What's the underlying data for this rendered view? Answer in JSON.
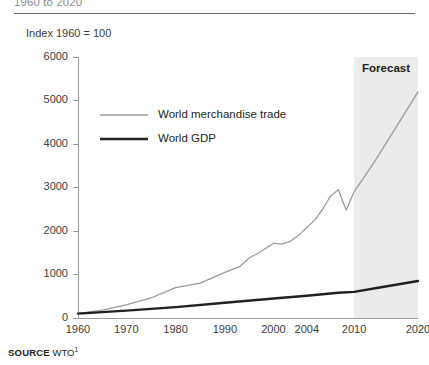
{
  "figure": {
    "title_clipped": "1960 to 2020",
    "unit_label": "Index 1960 = 100",
    "source_keyword": "SOURCE",
    "source_value": "WTO",
    "source_footnote": "1"
  },
  "colors": {
    "trade_line": "#9b9b9b",
    "gdp_line": "#231f20",
    "forecast_band": "#ebebeb",
    "axis": "#9a9a9a",
    "text": "#231f20",
    "rule": "#6a6a6a"
  },
  "chart_data": {
    "type": "line",
    "title": "1960 to 2020",
    "subtitle": "",
    "xlabel": "",
    "ylabel": "Index 1960 = 100",
    "ylim": [
      0,
      6000
    ],
    "xlim": [
      1960,
      2020
    ],
    "grid": false,
    "legend_position": "inside-top-left",
    "y_ticks": [
      0,
      1000,
      2000,
      3000,
      4000,
      5000,
      6000
    ],
    "y_tick_labels": [
      "0",
      "1000",
      "2000",
      "3000",
      "4000",
      "5000",
      "6000"
    ],
    "x_tick_labels": [
      "1960",
      "1970",
      "1980",
      "1990",
      "2000",
      "2004",
      "2010",
      "2020"
    ],
    "x_tick_values": [
      1960,
      1970,
      1980,
      1990,
      2000,
      2004,
      2010,
      2020
    ],
    "x_tick_fractions": [
      0.0,
      0.142,
      0.287,
      0.432,
      0.575,
      0.673,
      0.812,
      1.0
    ],
    "annotations": [
      {
        "label": "Forecast",
        "type": "shaded-band",
        "x_start": 2010,
        "x_end": 2020
      }
    ],
    "series": [
      {
        "name": "World merchandise trade",
        "style": "thin-gray",
        "color": "#9b9b9b",
        "width": 1.3,
        "x": [
          1960,
          1965,
          1970,
          1975,
          1980,
          1985,
          1990,
          1993,
          1995,
          1997,
          2000,
          2001,
          2002,
          2003,
          2004,
          2005,
          2006,
          2007,
          2008,
          2009,
          2010,
          2013,
          2016,
          2020
        ],
        "values": [
          100,
          180,
          300,
          460,
          700,
          800,
          1050,
          1180,
          1380,
          1500,
          1720,
          1700,
          1760,
          1900,
          2080,
          2250,
          2500,
          2800,
          2950,
          2480,
          2900,
          3550,
          4250,
          5200
        ]
      },
      {
        "name": "World GDP",
        "style": "thick-black",
        "color": "#231f20",
        "width": 2.4,
        "x": [
          1960,
          1970,
          1980,
          1990,
          2000,
          2004,
          2008,
          2010,
          2014,
          2020
        ],
        "values": [
          100,
          170,
          250,
          350,
          450,
          510,
          580,
          600,
          700,
          850
        ]
      }
    ]
  },
  "legend": {
    "items": [
      {
        "label": "World merchandise trade"
      },
      {
        "label": "World GDP"
      }
    ]
  }
}
